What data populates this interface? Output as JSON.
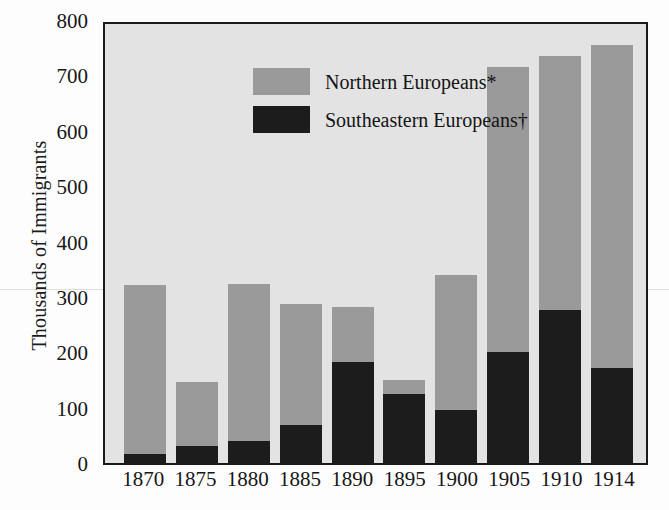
{
  "chart_data": {
    "type": "bar",
    "subtype": "stacked-vertical",
    "title": "",
    "xlabel": "",
    "ylabel": "Thousands of Immigrants",
    "categories": [
      "1870",
      "1875",
      "1880",
      "1885",
      "1890",
      "1895",
      "1900",
      "1905",
      "1910",
      "1914"
    ],
    "series": [
      {
        "name": "Southeastern Europeans†",
        "key": "southeastern",
        "color": "#1c1c1c",
        "values": [
          16,
          31,
          40,
          70,
          184,
          125,
          97,
          202,
          278,
          173
        ]
      },
      {
        "name": "Northern Europeans*",
        "key": "northern",
        "color": "#9a9a9a",
        "values": [
          309,
          117,
          287,
          219,
          101,
          27,
          246,
          520,
          464,
          589
        ]
      }
    ],
    "totals": [
      325,
      148,
      327,
      289,
      285,
      152,
      343,
      722,
      742,
      762
    ],
    "stack_order": [
      "southeastern",
      "northern"
    ],
    "ylim": [
      0,
      800
    ],
    "yticks": [
      800,
      700,
      600,
      500,
      400,
      300,
      200,
      100,
      0
    ],
    "ytick_labels": [
      "800",
      "700",
      "600",
      "500",
      "400",
      "300",
      "200",
      "100",
      "0"
    ],
    "grid": false,
    "legend_position": "top-left",
    "plot_background": "#e3e3e3",
    "axis_color": "#1a1a1a"
  },
  "axes": {
    "y_title": "Thousands of Immigrants"
  },
  "legend": {
    "entries": [
      {
        "label": "Northern Europeans*",
        "color": "#9a9a9a",
        "swatch_name": "legend-swatch-northern"
      },
      {
        "label": "Southeastern Europeans†",
        "color": "#1c1c1c",
        "swatch_name": "legend-swatch-southeastern"
      }
    ]
  }
}
